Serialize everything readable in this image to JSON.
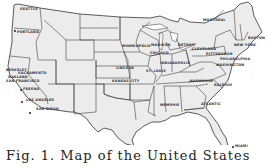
{
  "map": {
    "title": "United States map with city markers",
    "style": {
      "land_fill": "#ececec",
      "border_color": "#333333",
      "background": "#ffffff"
    },
    "cities": [
      {
        "name": "SEATTLE",
        "x": 27,
        "y": 10
      },
      {
        "name": "PORTLAND",
        "x": 17,
        "y": 31
      },
      {
        "name": "BERKELEY",
        "x": 6,
        "y": 72
      },
      {
        "name": "SACRAMENTO",
        "x": 18,
        "y": 75
      },
      {
        "name": "OAKLAND",
        "x": 6,
        "y": 78
      },
      {
        "name": "SAN FRANCISCO",
        "x": 6,
        "y": 81
      },
      {
        "name": "FRESNO",
        "x": 22,
        "y": 89
      },
      {
        "name": "LOS ANGELES",
        "x": 26,
        "y": 100
      },
      {
        "name": "SAN DIEGO",
        "x": 36,
        "y": 108
      },
      {
        "name": "MINNEAPOLIS",
        "x": 124,
        "y": 45
      },
      {
        "name": "LINCOLN",
        "x": 116,
        "y": 67
      },
      {
        "name": "KANSAS CITY",
        "x": 114,
        "y": 79
      },
      {
        "name": "MONTREAL",
        "x": 209,
        "y": 20
      },
      {
        "name": "MADISON",
        "x": 162,
        "y": 44
      },
      {
        "name": "CHICAGO",
        "x": 166,
        "y": 52
      },
      {
        "name": "DETROIT",
        "x": 186,
        "y": 44
      },
      {
        "name": "CLEVELAND",
        "x": 198,
        "y": 51
      },
      {
        "name": "PITTSBURGH",
        "x": 210,
        "y": 55
      },
      {
        "name": "PHILADELPHIA",
        "x": 225,
        "y": 57
      },
      {
        "name": "NEW YORK",
        "x": 236,
        "y": 43
      },
      {
        "name": "BOSTON",
        "x": 250,
        "y": 36
      },
      {
        "name": "ST. LOUIS",
        "x": 152,
        "y": 69
      },
      {
        "name": "INDIANAPOLIS",
        "x": 170,
        "y": 64
      },
      {
        "name": "WASHINGTON",
        "x": 224,
        "y": 64
      },
      {
        "name": "RALEIGH",
        "x": 220,
        "y": 84
      },
      {
        "name": "NASHVILLE",
        "x": 180,
        "y": 84
      },
      {
        "name": "MEMPHIS",
        "x": 165,
        "y": 104
      },
      {
        "name": "ATLANTIC",
        "x": 205,
        "y": 103
      },
      {
        "name": "MIAMI",
        "x": 239,
        "y": 146
      }
    ]
  },
  "caption": {
    "text": "Fig. 1. Map of the United States"
  }
}
